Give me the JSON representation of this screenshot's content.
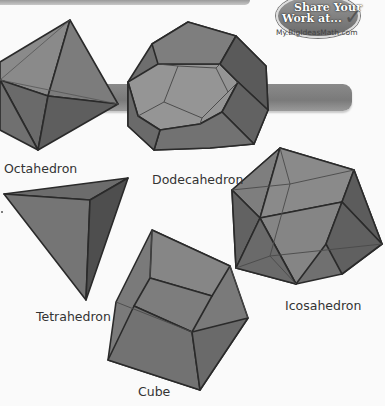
{
  "banner": {
    "line1": "Share Your",
    "line2": "Work at...",
    "url": "My.BigIdeasMath.com",
    "icon": "pencil-check-icon"
  },
  "solids": [
    {
      "name": "Octahedron"
    },
    {
      "name": "Dodecahedron"
    },
    {
      "name": "Tetrahedron"
    },
    {
      "name": "Icosahedron"
    },
    {
      "name": "Cube"
    }
  ],
  "colors": {
    "face_light": "#8c8c8c",
    "face_mid": "#747474",
    "face_dark": "#5e5e5e",
    "edge": "#2a2a2a",
    "background": "#fafafa"
  }
}
